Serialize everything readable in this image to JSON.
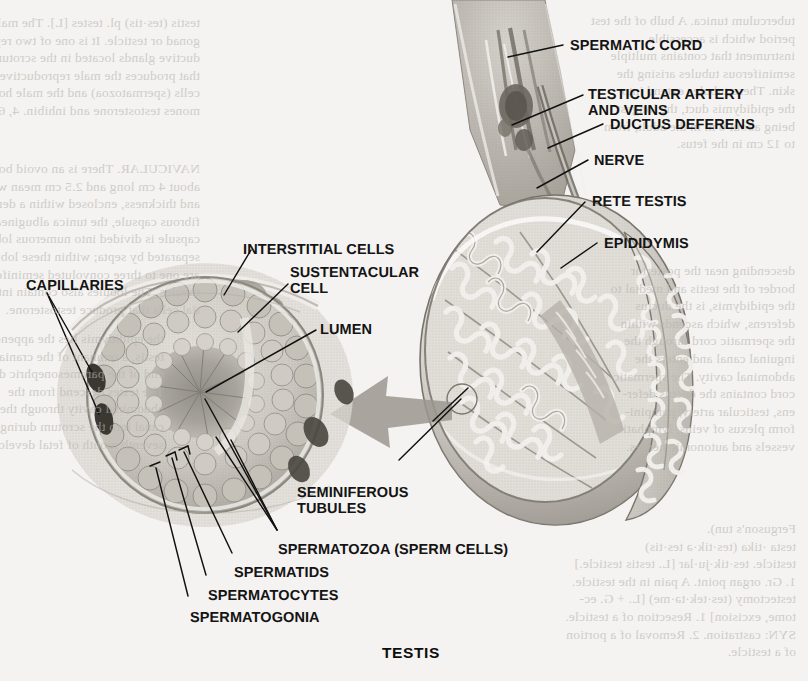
{
  "figure": {
    "title": "TESTIS",
    "kind": "anatomical-illustration",
    "style": "grayscale halftone textbook plate on aged paper"
  },
  "labels": {
    "spermatic_cord": "SPERMATIC CORD",
    "testicular_artery_1": "TESTICULAR ARTERY",
    "testicular_artery_2": "AND VEINS",
    "ductus_deferens": "DUCTUS DEFERENS",
    "nerve": "NERVE",
    "rete_testis": "RETE TESTIS",
    "epididymis": "EPIDIDYMIS",
    "interstitial_cells": "INTERSTITIAL CELLS",
    "sustentacular_1": "SUSTENTACULAR",
    "sustentacular_2": "CELL",
    "lumen": "LUMEN",
    "capillaries": "CAPILLARIES",
    "seminiferous_1": "SEMINIFEROUS",
    "seminiferous_2": "TUBULES",
    "spermatozoa": "SPERMATOZOA (SPERM CELLS)",
    "spermatids": "SPERMATIDS",
    "spermatocytes": "SPERMATOCYTES",
    "spermatogonia": "SPERMATOGONIA"
  },
  "colors": {
    "paper": "#f4f3f1",
    "ink": "#141414",
    "leader": "#111111",
    "tissue_light": "#dedbd6",
    "tissue_mid": "#b9b5ae",
    "tissue_dark": "#8e8a83",
    "tissue_deep": "#6d6962",
    "arrow": "#9b978f",
    "bleed_text": "#b9b6b2"
  },
  "bleed_text": {
    "top_left": "testis (tes·tis) pl. testes [L]. The male\ngonad or testicle. It is one of two repro-\nductive glands located in the scrotum\nthat produces the male reproductive\ncells (spermatozoa) and the male hor-\nmones testosterone and inhibin. 4, 6",
    "mid_left": "NAVICULAR. There is an ovoid body\nabout 4 cm long and 2.5 cm mean width\nand thickness, enclosed within a dense\nfibrous capsule, the tunica albuginea. The\ncapsule is divided into numerous lobules\nseparated by septa; within these lobules\nare one to three convoluted seminiferous\ntubules. The lobules also contain intersti-\ntial cells that produce testosterone.",
    "top_right": "tuberculum tunica. A bulb of the test\nperiod which is accessible\ninstrument that contains multiple\nseminiferous tubules arising the\nskin. These tubules extend into\nthe epididymis duct, the longest\nbeing about 6 m in the adult, from\nto 12 cm in the fetus.",
    "mid_right": "descending near the posterior\nborder of the testis and medial to\nthe epididymis, is the ductus\ndeferens, which ascends within\nthe spermatic cord through the\ninguinal canal and enters the\nabdominal cavity. The spermatic\ncord contains the ductus defer-\nens, testicular artery, pampini-\nform plexus of veins, lymphatic\nvessels and autonomic nerves.",
    "bottom_right": "Ferguson's tun).\ntesta ·tika (tes·tik·ə tes·tis)\ntesticle. tes·tik·ju·lar [L. testis testicle.]\n1. Gr. organ point. A pain in the testicle.\ntestectomy (tes·tek·tə·me) [L. + G. ec-\ntome, excision] 1. Resection of a testicle.\nSYN: castration. 2. Removal of a portion\nof a testicle.",
    "bottom_left": "the epididymis lies the appendix\ntestis, a remnant of the cranial\nend of the paramesonephric duct.\nThe testes descend from the\nabdominal cavity through the inguinal\ncanal into the scrotum during the\nseventh month of fetal development."
  }
}
